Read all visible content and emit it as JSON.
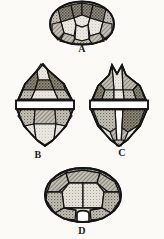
{
  "plate": {
    "title": "Dinoflagellate theca plate illustrations",
    "description": "Four line-engraving figures of an armoured dinoflagellate cell (Peridinium-type) shown in different views, labelled A through D.",
    "background_color": "#fbfaf7",
    "ink_color": "#1a1a1a",
    "fill_light": "#e9e6de",
    "fill_mid": "#b9b4a8",
    "fill_dark": "#8c867a",
    "figures": [
      {
        "id": "A",
        "caption": "A",
        "view": "apical view",
        "shape": "rounded polygonal disc with radiating plate sutures",
        "caption_x": 80,
        "caption_y": 48
      },
      {
        "id": "B",
        "caption": "B",
        "view": "ventral view",
        "shape": "biconical cell with horizontal cingulum girdle band",
        "caption_x": 36,
        "caption_y": 154
      },
      {
        "id": "C",
        "caption": "C",
        "view": "dorsal view",
        "shape": "biconical cell with cingulum and vertical sulcus furrow",
        "caption_x": 120,
        "caption_y": 152
      },
      {
        "id": "D",
        "caption": "D",
        "view": "antapical view",
        "shape": "rounded disc with notched antapical pore",
        "caption_x": 80,
        "caption_y": 230
      }
    ]
  }
}
